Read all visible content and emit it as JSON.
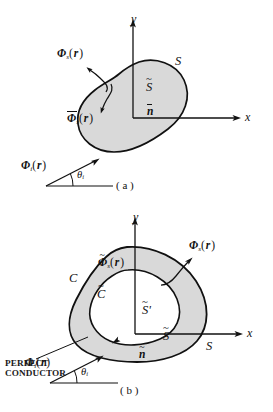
{
  "figure": {
    "background_color": "#ffffff",
    "ink_color": "#111111",
    "shade_color": "#d9d9d9",
    "panels": [
      {
        "id": "a",
        "caption": "( a )",
        "axes": {
          "x_label": "x",
          "y_label": "y"
        },
        "labels": {
          "scattered_field_outer": {
            "phi": "Φ",
            "sub": "s",
            "arg": "r",
            "decoration": "none"
          },
          "scattered_field_inner": {
            "phi": "Φ",
            "sub": "s",
            "arg": "r",
            "decoration": "overbar"
          },
          "surface_outer": {
            "text": "S",
            "decoration": "none"
          },
          "surface_inner": {
            "text": "S",
            "decoration": "tilde"
          },
          "normal": {
            "text": "n",
            "decoration": "overbar"
          },
          "incident_field": {
            "phi": "Φ",
            "sub": "i",
            "arg": "r",
            "decoration": "none"
          },
          "incidence_angle": {
            "theta": "θ",
            "sub": "i"
          }
        }
      },
      {
        "id": "b",
        "caption": "( b )",
        "axes": {
          "x_label": "x",
          "y_label": "y"
        },
        "labels": {
          "scattered_field_outer": {
            "phi": "Φ",
            "sub": "s",
            "arg": "r",
            "decoration": "none"
          },
          "scattered_field_inner": {
            "phi": "Φ",
            "sub": "s",
            "arg": "r",
            "decoration": "tilde"
          },
          "contour_outer": {
            "text": "C",
            "decoration": "none"
          },
          "contour_inner": {
            "text": "C",
            "decoration": "tilde"
          },
          "surface_outer": {
            "text": "S",
            "decoration": "none"
          },
          "surface_inner": {
            "text": "S",
            "decoration": "tilde"
          },
          "surface_inner_prime": {
            "text": "S",
            "decoration": "tilde",
            "prime": "'"
          },
          "normal": {
            "text": "n",
            "decoration": "tilde"
          },
          "conductor_line1": "PERFECT",
          "conductor_line2": "CONDUCTOR",
          "incident_field": {
            "phi": "Φ",
            "sub": "i",
            "arg": "r",
            "decoration": "none"
          },
          "incidence_angle": {
            "theta": "θ",
            "sub": "i"
          }
        }
      }
    ]
  }
}
